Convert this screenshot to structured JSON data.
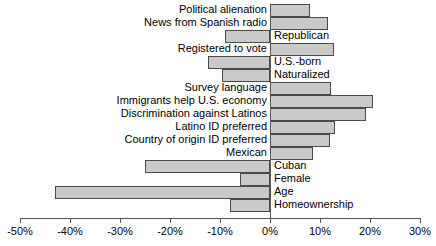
{
  "chart_data": {
    "type": "bar",
    "orientation": "horizontal",
    "title": "",
    "xlabel": "",
    "ylabel": "",
    "xlim": [
      -50,
      30
    ],
    "xticks": [
      -50,
      -40,
      -30,
      -20,
      -10,
      0,
      10,
      20,
      30
    ],
    "xticklabels": [
      "-50%",
      "-40%",
      "-30%",
      "-20%",
      "-10%",
      "0%",
      "10%",
      "20%",
      "30%"
    ],
    "grid": false,
    "legend": null,
    "categories": [
      "Political alienation",
      "News from Spanish radio",
      "Republican",
      "Registered to vote",
      "U.S.-born",
      "Naturalized",
      "Survey language",
      "Immigrants help U.S. economy",
      "Discrimination against Latinos",
      "Latino ID preferred",
      "Country of origin ID preferred",
      "Mexican",
      "Cuban",
      "Female",
      "Age",
      "Homeownership"
    ],
    "values": [
      8,
      11.5,
      -9,
      12.8,
      -12.4,
      -9.6,
      12.2,
      20.6,
      19.2,
      13,
      12,
      8.5,
      -25,
      -6,
      -43,
      -8
    ],
    "bar_fill_color": "#c9c9c9",
    "bar_edge_color": "#4a4a4a",
    "axis_color": "#555555"
  },
  "bars": [
    {
      "label": "Political alienation",
      "value": 8
    },
    {
      "label": "News from Spanish radio",
      "value": 11.5
    },
    {
      "label": "Republican",
      "value": -9
    },
    {
      "label": "Registered to vote",
      "value": 12.8
    },
    {
      "label": "U.S.-born",
      "value": -12.4
    },
    {
      "label": "Naturalized",
      "value": -9.6
    },
    {
      "label": "Survey language",
      "value": 12.2
    },
    {
      "label": "Immigrants help U.S. economy",
      "value": 20.6
    },
    {
      "label": "Discrimination against Latinos",
      "value": 19.2
    },
    {
      "label": "Latino ID preferred",
      "value": 13
    },
    {
      "label": "Country of origin ID preferred",
      "value": 12
    },
    {
      "label": "Mexican",
      "value": 8.5
    },
    {
      "label": "Cuban",
      "value": -25
    },
    {
      "label": "Female",
      "value": -6
    },
    {
      "label": "Age",
      "value": -43
    },
    {
      "label": "Homeownership",
      "value": -8
    }
  ]
}
